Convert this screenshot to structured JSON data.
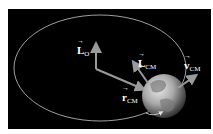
{
  "diagram": {
    "colors": {
      "background": "#000000",
      "orbit": "#c8c8c8",
      "arrow": "#9a9a9a",
      "label": "#ffffff"
    },
    "labels": {
      "L_O": {
        "symbol": "L",
        "subscript": "O"
      },
      "L_CM": {
        "symbol": "L",
        "subscript": "CM"
      },
      "v_CM": {
        "symbol": "v",
        "subscript": "CM"
      },
      "r_CM": {
        "symbol": "r",
        "subscript": "CM"
      }
    }
  }
}
